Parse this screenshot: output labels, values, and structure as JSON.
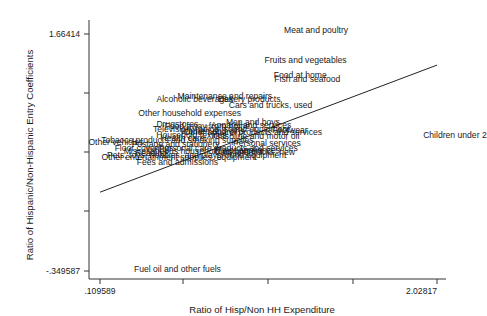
{
  "chart_data": {
    "type": "scatter",
    "title": "",
    "xlabel": "Ratio of Hisp/Non HH Expenditure",
    "ylabel": "Ratio of Hispanic/Non-Hispanic Entry Coefficients",
    "xlim": [
      0.109589,
      2.02817
    ],
    "ylim": [
      -0.349587,
      1.66414
    ],
    "x_tick_labels": [
      ".109589",
      "",
      "",
      "",
      "2.02817"
    ],
    "y_tick_labels": [
      "1.66414",
      "",
      "",
      "",
      "-.349587"
    ],
    "grid": false,
    "legend": null,
    "marker": "label-only",
    "fit_line": {
      "x0": 0.109589,
      "y0": 0.32,
      "x1": 2.02817,
      "y1": 1.4
    },
    "points": [
      {
        "label": "Meat and poultry",
        "x": 1.34,
        "y": 1.7
      },
      {
        "label": "Fruits and vegetables",
        "x": 1.28,
        "y": 1.44
      },
      {
        "label": "Food at home",
        "x": 1.25,
        "y": 1.32
      },
      {
        "label": "Fish and seafood",
        "x": 1.29,
        "y": 1.28
      },
      {
        "label": "Maintenance and repairs",
        "x": 0.82,
        "y": 1.14
      },
      {
        "label": "Alcoholic beverages",
        "x": 0.65,
        "y": 1.11
      },
      {
        "label": "Bakery products",
        "x": 0.96,
        "y": 1.11
      },
      {
        "label": "Cars and trucks, used",
        "x": 1.08,
        "y": 1.06
      },
      {
        "label": "Other household expenses",
        "x": 0.62,
        "y": 0.99
      },
      {
        "label": "Drugstores",
        "x": 0.55,
        "y": 0.9
      },
      {
        "label": "Men and boys",
        "x": 0.98,
        "y": 0.92
      },
      {
        "label": "Apparel and services",
        "x": 0.97,
        "y": 0.89
      },
      {
        "label": "Food away from home",
        "x": 0.72,
        "y": 0.88
      },
      {
        "label": "Television, radios, sound equipment",
        "x": 0.8,
        "y": 0.86
      },
      {
        "label": "Footwear",
        "x": 1.19,
        "y": 0.85
      },
      {
        "label": "Women and girls",
        "x": 0.75,
        "y": 0.84
      },
      {
        "label": "Other apparel products and services",
        "x": 0.98,
        "y": 0.83
      },
      {
        "label": "Household textiles",
        "x": 0.63,
        "y": 0.81
      },
      {
        "label": "Gasoline and motor oil",
        "x": 1.0,
        "y": 0.8
      },
      {
        "label": "Health care",
        "x": 0.58,
        "y": 0.78
      },
      {
        "label": "Tobacco products and smoking supplies",
        "x": 0.55,
        "y": 0.76
      },
      {
        "label": "Other vehicles",
        "x": 0.2,
        "y": 0.75
      },
      {
        "label": "Personal services",
        "x": 1.06,
        "y": 0.74
      },
      {
        "label": "Postage and stationery",
        "x": 0.54,
        "y": 0.73
      },
      {
        "label": "Floor coverings",
        "x": 0.36,
        "y": 0.7
      },
      {
        "label": "Personal care products and services",
        "x": 0.84,
        "y": 0.7
      },
      {
        "label": "Major appliances",
        "x": 0.95,
        "y": 0.68
      },
      {
        "label": "Miscellaneous household equipment",
        "x": 0.64,
        "y": 0.67
      },
      {
        "label": "Cars and trucks, new",
        "x": 0.99,
        "y": 0.66
      },
      {
        "label": "Reading",
        "x": 0.4,
        "y": 0.65
      },
      {
        "label": "Pets, toys, hobbies, and playground equipment",
        "x": 0.66,
        "y": 0.64
      },
      {
        "label": "Other entertainment supplies, equipment",
        "x": 0.56,
        "y": 0.62
      },
      {
        "label": "Fees and admissions",
        "x": 0.55,
        "y": 0.58
      },
      {
        "label": "Children under 2",
        "x": 2.13,
        "y": 0.81
      },
      {
        "label": "Fuel oil and other fuels",
        "x": 0.55,
        "y": -0.33
      }
    ]
  }
}
